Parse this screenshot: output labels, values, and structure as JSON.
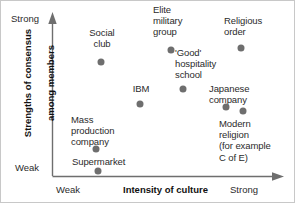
{
  "chart_data": {
    "type": "scatter",
    "title": "",
    "xlabel": "Intensity of culture",
    "ylabel": "Strengths of consensus among members",
    "ylabel_line1": "Strengths of consensus",
    "ylabel_line2": "among members",
    "x_tick_low": "Weak",
    "x_tick_high": "Strong",
    "y_tick_low": "Weak",
    "y_tick_high": "Strong",
    "xlim": [
      0,
      1
    ],
    "ylim": [
      0,
      1
    ],
    "grid": false,
    "legend": "none",
    "marker_color": "#6e6e6e",
    "axis_color": "#6e6e6e",
    "points": [
      {
        "label": "Social\nclub",
        "x": 0.21,
        "y": 0.8,
        "px": 100,
        "py": 61,
        "label_px": 80,
        "label_py": 26,
        "label_align": "center",
        "label_width": 42
      },
      {
        "label": "Elite\nmilitary\ngroup",
        "x": 0.51,
        "y": 0.88,
        "px": 170,
        "py": 49,
        "label_px": 152,
        "label_py": 3,
        "label_align": "left",
        "label_width": 44
      },
      {
        "label": "Religious\norder",
        "x": 0.8,
        "y": 0.89,
        "px": 240,
        "py": 47,
        "label_px": 223,
        "label_py": 14,
        "label_align": "left",
        "label_width": 50
      },
      {
        "label": "'Good'\nhospitality\nschool",
        "x": 0.56,
        "y": 0.62,
        "px": 182,
        "py": 88,
        "label_px": 174,
        "label_py": 46,
        "label_align": "left",
        "label_width": 56
      },
      {
        "label": "IBM",
        "x": 0.37,
        "y": 0.55,
        "px": 139,
        "py": 103,
        "label_px": 128,
        "label_py": 82,
        "label_align": "center",
        "label_width": 24
      },
      {
        "label": "Japanese\ncompany",
        "x": 0.74,
        "y": 0.53,
        "px": 225,
        "py": 106,
        "label_px": 208,
        "label_py": 82,
        "label_align": "left",
        "label_width": 52
      },
      {
        "label": "Modern\nreligion\n(for example\nC of E)",
        "x": 0.81,
        "y": 0.5,
        "px": 242,
        "py": 110,
        "label_px": 218,
        "label_py": 117,
        "label_align": "left",
        "label_width": 66
      },
      {
        "label": "Mass\nproduction\ncompany",
        "x": 0.22,
        "y": 0.24,
        "px": 95,
        "py": 148,
        "label_px": 70,
        "label_py": 113,
        "label_align": "left",
        "label_width": 56
      },
      {
        "label": "Supermarket",
        "x": 0.23,
        "y": 0.03,
        "px": 97,
        "py": 170,
        "label_px": 71,
        "label_py": 155,
        "label_align": "left",
        "label_width": 68
      }
    ]
  },
  "axis": {
    "y_high_label": "Strong",
    "y_low_label": "Weak",
    "x_low_label": "Weak",
    "x_high_label": "Strong",
    "x_title": "Intensity of culture",
    "y_title_line1": "Strengths of consensus",
    "y_title_line2": "among members"
  }
}
